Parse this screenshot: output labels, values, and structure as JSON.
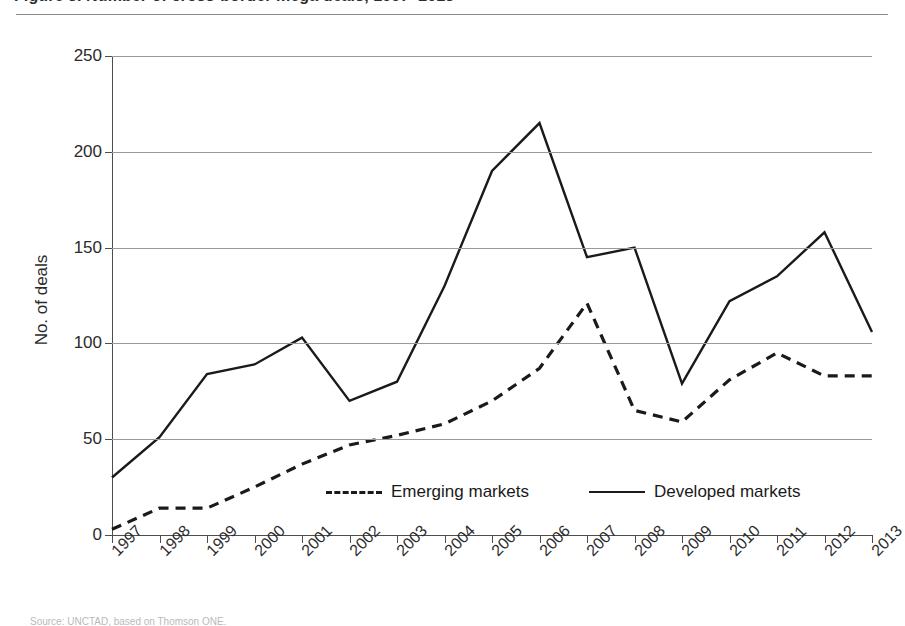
{
  "figure": {
    "title_clipped": "Figure 3.  Number of cross-border mega deals, 1997–2013",
    "source_clipped": "Source: UNCTAD, based on Thomson ONE."
  },
  "chart_data": {
    "type": "line",
    "title": "",
    "xlabel": "",
    "ylabel": "No. of deals",
    "ylim": [
      0,
      250
    ],
    "ytick_labels": [
      "0",
      "50",
      "100",
      "150",
      "200",
      "250"
    ],
    "ytick_values": [
      0,
      50,
      100,
      150,
      200,
      250
    ],
    "grid": true,
    "legend_position": "bottom-center",
    "categories": [
      "1997",
      "1998",
      "1999",
      "2000",
      "2001",
      "2002",
      "2003",
      "2004",
      "2005",
      "2006",
      "2007",
      "2008",
      "2009",
      "2010",
      "2011",
      "2012",
      "2013"
    ],
    "series": [
      {
        "name": "Emerging markets",
        "style": "dashed",
        "color": "#1a1a1a",
        "values": [
          3,
          14,
          14,
          25,
          37,
          47,
          52,
          58,
          70,
          87,
          121,
          65,
          59,
          81,
          95,
          83,
          83
        ]
      },
      {
        "name": "Developed markets",
        "style": "solid",
        "color": "#1a1a1a",
        "values": [
          30,
          51,
          84,
          89,
          103,
          70,
          80,
          130,
          190,
          215,
          145,
          150,
          79,
          122,
          135,
          158,
          106
        ]
      }
    ]
  },
  "legend": {
    "items": [
      {
        "label": "Emerging markets",
        "style": "dashed"
      },
      {
        "label": "Developed markets",
        "style": "solid"
      }
    ]
  }
}
